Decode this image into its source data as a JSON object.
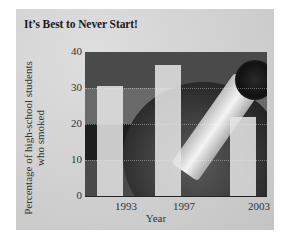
{
  "chart_data": {
    "type": "bar",
    "title": "It’s Best to Never Start!",
    "xlabel": "Year",
    "ylabel": "Percentage of high-school students who smoked",
    "ylabel_lines": [
      "Percentage of high-school students",
      "who smoked"
    ],
    "categories": [
      "1993",
      "1997",
      "2003"
    ],
    "values": [
      30.5,
      36.4,
      21.9
    ],
    "ylim": [
      0,
      40
    ],
    "yticks": [
      "0",
      "10",
      "20",
      "30",
      "40"
    ],
    "grid": true,
    "legend": null,
    "background": "photo of cigarette in ashtray"
  },
  "colors": {
    "panel": "#cfcfcf",
    "bar": "#e6e6e6",
    "plot_dark": "#2e2e2e",
    "text": "#333333"
  }
}
